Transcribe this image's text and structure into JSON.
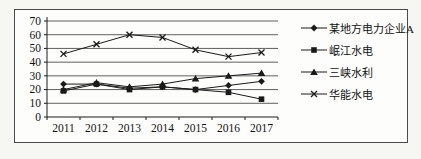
{
  "page": {
    "background": "#f6f6f3"
  },
  "chart": {
    "frame_border_color": "#4a4a4a",
    "plot_background": "#fdfdfc",
    "line_color": "#1a1a1a",
    "grid_color": "#5f5f5f",
    "axis_color": "#1a1a1a",
    "text_color": "#111111"
  },
  "chart_data": {
    "type": "line",
    "title": "",
    "xlabel": "",
    "ylabel": "",
    "categories": [
      "2011",
      "2012",
      "2013",
      "2014",
      "2015",
      "2016",
      "2017"
    ],
    "series": [
      {
        "name": "某地方电力企业A",
        "marker": "diamond",
        "values": [
          24,
          24,
          21,
          22,
          20,
          23,
          26
        ]
      },
      {
        "name": "岷江水电",
        "marker": "square",
        "values": [
          19,
          24,
          20,
          22,
          20,
          18,
          13
        ]
      },
      {
        "name": "三峡水利",
        "marker": "triangle",
        "values": [
          20,
          25,
          22,
          24,
          28,
          30,
          32
        ]
      },
      {
        "name": "华能水电",
        "marker": "x",
        "values": [
          46,
          53,
          60,
          58,
          49,
          44,
          47
        ]
      }
    ],
    "ylim": [
      0,
      70
    ],
    "ytick_step": 10,
    "yticks": [
      "0",
      "10",
      "20",
      "30",
      "40",
      "50",
      "60",
      "70"
    ],
    "grid": "horizontal",
    "legend_position": "right"
  }
}
